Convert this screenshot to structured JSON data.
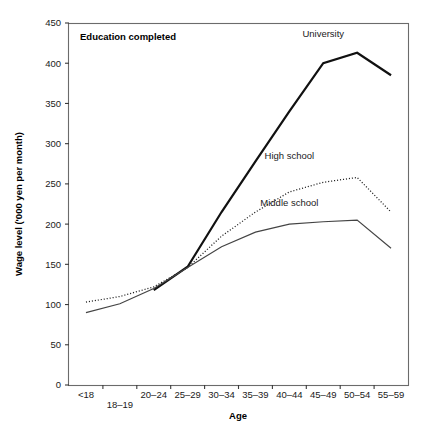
{
  "chart_data": {
    "type": "line",
    "title": "Education completed",
    "xlabel": "Age",
    "ylabel": "Wage level ('000 yen per month)",
    "categories": [
      "<18",
      "18–19",
      "20–24",
      "25–29",
      "30–34",
      "35–39",
      "40–44",
      "45–49",
      "50–54",
      "55–59"
    ],
    "ylim": [
      0,
      450
    ],
    "yticks": [
      0,
      50,
      100,
      150,
      200,
      250,
      300,
      350,
      400,
      450
    ],
    "ytick_labels": [
      "0",
      "50",
      "100",
      "150",
      "200",
      "250",
      "300",
      "350",
      "400",
      "450"
    ],
    "grid": false,
    "legend_position": "inline-labels",
    "series": [
      {
        "name": "University",
        "style": "thick-solid",
        "label": "University",
        "values": [
          null,
          null,
          118,
          147,
          215,
          278,
          340,
          400,
          413,
          385
        ]
      },
      {
        "name": "High school",
        "style": "dotted",
        "label": "High school",
        "values": [
          103,
          110,
          122,
          146,
          185,
          215,
          240,
          252,
          258,
          215
        ]
      },
      {
        "name": "Middle school",
        "style": "thin-solid",
        "label": "Middle school",
        "values": [
          90,
          101,
          120,
          146,
          172,
          190,
          200,
          203,
          205,
          170
        ]
      }
    ],
    "annotations": [
      {
        "text": "University",
        "category": "45–49",
        "value": 432
      },
      {
        "text": "High school",
        "category": "40–44",
        "value": 281
      },
      {
        "text": "Middle school",
        "category": "40–44",
        "value": 222
      }
    ]
  }
}
